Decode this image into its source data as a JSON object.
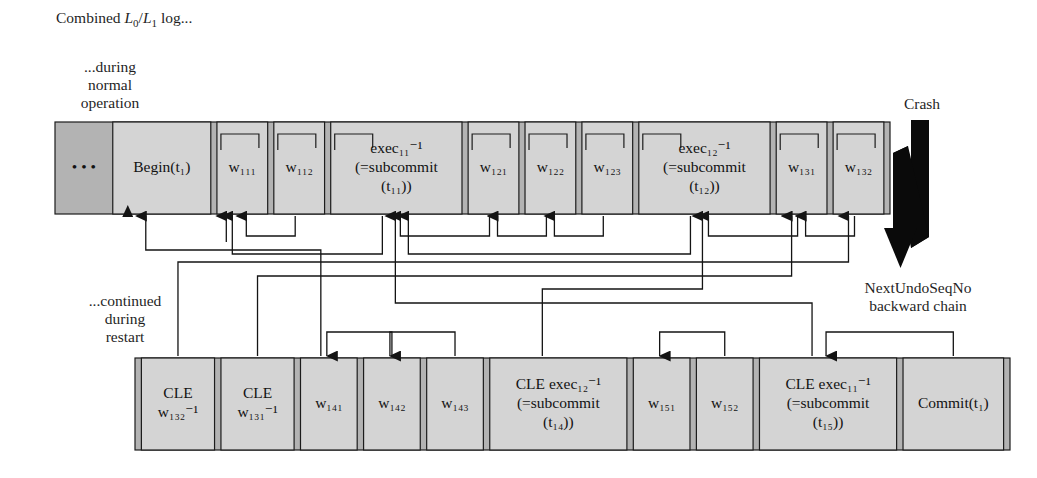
{
  "figure": {
    "caption": {
      "prefix": "Combined ",
      "l0": "L",
      "l0sub": "0",
      "slash": "/",
      "l1": "L",
      "l1sub": "1",
      "suffix": " log..."
    },
    "annotations": {
      "normal": {
        "line1": "...during",
        "line2": "normal",
        "line3": "operation"
      },
      "restart": {
        "line1": "...continued",
        "line2": "during",
        "line3": "restart"
      },
      "crash": "Crash",
      "chain": {
        "line1": "NextUndoSeqNo",
        "line2": "backward chain"
      }
    }
  },
  "top_row": {
    "name": "during normal operation log",
    "entries": [
      {
        "id": "ellipsis",
        "lines": [
          "• • •"
        ],
        "kind": "ellipsis",
        "hook": false
      },
      {
        "id": "begin-t1",
        "lines": [
          "Begin(t₁)"
        ],
        "kind": "begin",
        "hook": false
      },
      {
        "id": "w111",
        "lines": [
          "w₁₁₁"
        ],
        "kind": "write",
        "hook": true
      },
      {
        "id": "w112",
        "lines": [
          "w₁₁₂"
        ],
        "kind": "write",
        "hook": true
      },
      {
        "id": "exec11",
        "lines": [
          "exec₁₁⁻¹",
          "(=subcommit",
          "(t₁₁))"
        ],
        "kind": "exec",
        "hook": true
      },
      {
        "id": "w121",
        "lines": [
          "w₁₂₁"
        ],
        "kind": "write",
        "hook": true
      },
      {
        "id": "w122",
        "lines": [
          "w₁₂₂"
        ],
        "kind": "write",
        "hook": true
      },
      {
        "id": "w123",
        "lines": [
          "w₁₂₃"
        ],
        "kind": "write",
        "hook": true
      },
      {
        "id": "exec12",
        "lines": [
          "exec₁₂⁻¹",
          "(=subcommit",
          "(t₁₂))"
        ],
        "kind": "exec",
        "hook": true
      },
      {
        "id": "w131",
        "lines": [
          "w₁₃₁"
        ],
        "kind": "write",
        "hook": true
      },
      {
        "id": "w132",
        "lines": [
          "w₁₃₂"
        ],
        "kind": "write",
        "hook": true
      }
    ]
  },
  "bottom_row": {
    "name": "continued during restart log",
    "entries": [
      {
        "id": "cle-w132",
        "lines": [
          "CLE",
          "w₁₃₂⁻¹"
        ],
        "kind": "cle"
      },
      {
        "id": "cle-w131",
        "lines": [
          "CLE",
          "w₁₃₁⁻¹"
        ],
        "kind": "cle"
      },
      {
        "id": "w141",
        "lines": [
          "w₁₄₁"
        ],
        "kind": "write"
      },
      {
        "id": "w142",
        "lines": [
          "w₁₄₂"
        ],
        "kind": "write"
      },
      {
        "id": "w143",
        "lines": [
          "w₁₄₃"
        ],
        "kind": "write"
      },
      {
        "id": "cle-exec12",
        "lines": [
          "CLE exec₁₂⁻¹",
          "(=subcommit",
          "(t₁₄))"
        ],
        "kind": "cle-exec"
      },
      {
        "id": "w151",
        "lines": [
          "w₁₅₁"
        ],
        "kind": "write"
      },
      {
        "id": "w152",
        "lines": [
          "w₁₅₂"
        ],
        "kind": "write"
      },
      {
        "id": "cle-exec11",
        "lines": [
          "CLE exec₁₁⁻¹",
          "(=subcommit",
          "(t₁₅))"
        ],
        "kind": "cle-exec"
      },
      {
        "id": "commit-t1",
        "lines": [
          "Commit(t₁)"
        ],
        "kind": "commit"
      }
    ]
  },
  "colors": {
    "cell_fill": "#d4d4d4",
    "band_fill": "#b3b3b3",
    "stroke": "#1c1c1c",
    "chain": "#141414",
    "text": "#121212"
  }
}
